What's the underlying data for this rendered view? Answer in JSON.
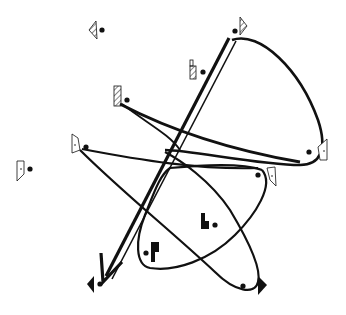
{
  "diagram": {
    "type": "path-diagram",
    "colors": {
      "ink": "#111111",
      "background": "#ffffff"
    },
    "markers": [
      {
        "id": "m1",
        "glyph": "hatched-triangle-left",
        "x": 90,
        "y": 30
      },
      {
        "id": "m2",
        "glyph": "hatched-triangle-right",
        "x": 240,
        "y": 24
      },
      {
        "id": "m3",
        "glyph": "hatched-bar-tall",
        "x": 191,
        "y": 70
      },
      {
        "id": "m4",
        "glyph": "hatched-bar",
        "x": 117,
        "y": 96
      },
      {
        "id": "m5",
        "glyph": "outline-pentagon-dot",
        "x": 77,
        "y": 145
      },
      {
        "id": "m6",
        "glyph": "outline-pentagon-dot",
        "x": 324,
        "y": 150
      },
      {
        "id": "m7",
        "glyph": "outline-pentagon-dot",
        "x": 271,
        "y": 178
      },
      {
        "id": "m8",
        "glyph": "outline-pentagon-dot",
        "x": 21,
        "y": 169
      },
      {
        "id": "m9",
        "glyph": "solid-bar-step",
        "x": 204,
        "y": 222
      },
      {
        "id": "m10",
        "glyph": "solid-bar",
        "x": 153,
        "y": 253
      },
      {
        "id": "m11",
        "glyph": "solid-triangle-left",
        "x": 92,
        "y": 284
      },
      {
        "id": "m12",
        "glyph": "solid-triangle-right",
        "x": 263,
        "y": 286
      }
    ],
    "curves": [
      {
        "id": "c1",
        "kind": "loop",
        "from": "m2",
        "via": "m6",
        "label": "upper loop"
      },
      {
        "id": "c2",
        "kind": "curve",
        "from": "m4",
        "to": "m6"
      },
      {
        "id": "c3",
        "kind": "curve",
        "from": "m5",
        "to": "m7"
      },
      {
        "id": "c4",
        "kind": "loop",
        "from": "m7",
        "via": "m10",
        "label": "lower-left loop"
      },
      {
        "id": "c5",
        "kind": "loop",
        "from": "m5",
        "via": "m12",
        "label": "lower-right loop"
      },
      {
        "id": "c6",
        "kind": "double-arrow",
        "from": "m2",
        "to": "m11"
      }
    ]
  }
}
